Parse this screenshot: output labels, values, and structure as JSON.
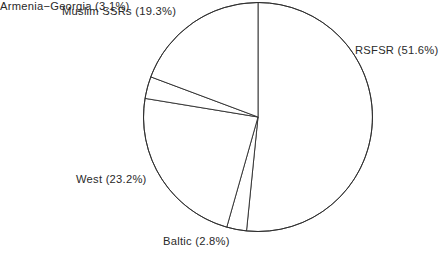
{
  "chart_data": {
    "type": "pie",
    "title": "",
    "subtitle": "",
    "xlabel": "",
    "ylabel": "",
    "legend_position": "none",
    "grid": false,
    "start_angle_deg": 90,
    "direction": "clockwise",
    "categories": [
      "RSFSR",
      "Baltic",
      "West",
      "Armenia−Georgia",
      "Muslim SSRs"
    ],
    "values": [
      51.6,
      2.8,
      23.2,
      3.1,
      19.3
    ],
    "units": "percent",
    "labels": [
      "RSFSR (51.6%)",
      "Baltic (2.8%)",
      "West (23.2%)",
      "Armenia−Georgia (3.1%)",
      "Muslim SSRs (19.3%)"
    ],
    "slices": [
      {
        "name": "RSFSR",
        "value": 51.6,
        "label": "RSFSR (51.6%)",
        "fill": "#ffffff",
        "stroke": "#2b2b2b"
      },
      {
        "name": "Baltic",
        "value": 2.8,
        "label": "Baltic (2.8%)",
        "fill": "#ffffff",
        "stroke": "#2b2b2b"
      },
      {
        "name": "West",
        "value": 23.2,
        "label": "West (23.2%)",
        "fill": "#ffffff",
        "stroke": "#2b2b2b"
      },
      {
        "name": "Armenia−Georgia",
        "value": 3.1,
        "label": "Armenia−Georgia (3.1%)",
        "fill": "#ffffff",
        "stroke": "#2b2b2b"
      },
      {
        "name": "Muslim SSRs",
        "value": 19.3,
        "label": "Muslim SSRs (19.3%)",
        "fill": "#ffffff",
        "stroke": "#2b2b2b"
      }
    ],
    "total": 100.0
  },
  "geometry": {
    "center_x": 258,
    "center_y": 117,
    "radius": 114.5
  },
  "colors": {
    "background": "#ffffff",
    "line": "#2b2b2b",
    "text": "#2a2a2a"
  }
}
